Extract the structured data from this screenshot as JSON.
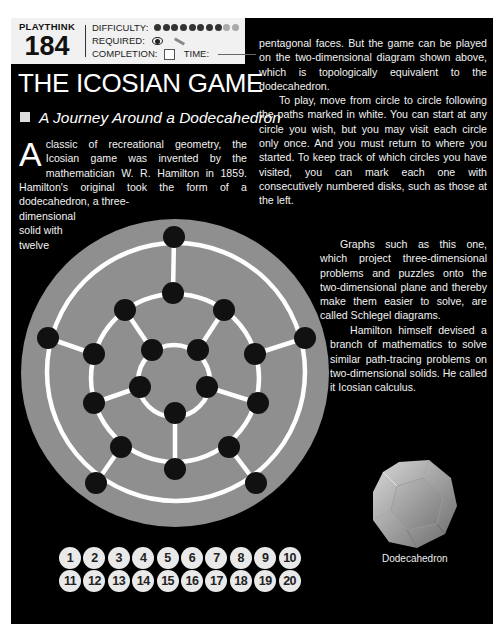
{
  "header": {
    "series_label": "PLAYTHINK",
    "puzzle_number": "184",
    "difficulty_label": "DIFFICULTY:",
    "difficulty": {
      "filled": 8,
      "total": 10
    },
    "required_label": "REQUIRED:",
    "required_icons": [
      "eye-icon",
      "pencil-icon"
    ],
    "completion_label": "COMPLETION:",
    "time_label": "TIME:"
  },
  "title": "THE ICOSIAN GAME",
  "subtitle": "A Journey Around a Dodecahedron",
  "intro": {
    "dropcap": "A",
    "text": "classic of recreational geometry, the Icosian game was invented by the mathematician W. R. Hamilton in 1859. Hamilton's original took the form of a dodecahedron, a three-",
    "narrow_lines": [
      "dimensional",
      "solid with",
      "twelve"
    ]
  },
  "right_column": {
    "para1": "pentagonal faces. But the game can be played on the two-dimensional diagram shown above, which is topologically equivalent to the dodecahedron.",
    "para2": "To play, move from circle to circle following the paths marked in white. You can start at any circle you wish, but you may visit each circle only once. And you must return to where you started. To keep track of which circles you have visited, you can mark each one with consecutively numbered disks, such as those at the left.",
    "para3": "Graphs such as this one, which project three-dimensional problems and puzzles onto the two-dimensional plane and thereby make them easier to solve, are called Schlegel diagrams.",
    "para4": "Hamilton himself devised a branch of mathematics to solve similar path-tracing problems on two-dimensional solids. He called it Icosian calculus."
  },
  "diagram": {
    "name": "Schlegel diagram of dodecahedron",
    "node_count": 20,
    "colors": {
      "disc": "#8f8f8f",
      "path": "#ffffff",
      "node": "#111111"
    }
  },
  "disks": [
    "1",
    "2",
    "3",
    "4",
    "5",
    "6",
    "7",
    "8",
    "9",
    "10",
    "11",
    "12",
    "13",
    "14",
    "15",
    "16",
    "17",
    "18",
    "19",
    "20"
  ],
  "dodecahedron_caption": "Dodecahedron",
  "colors": {
    "page_bg": "#000000",
    "header_bg": "#f1f1f1",
    "text": "#f2f2f2"
  }
}
